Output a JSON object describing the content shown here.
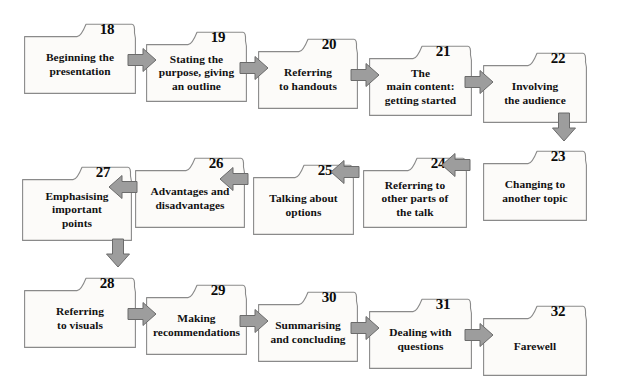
{
  "diagram": {
    "type": "flowchart",
    "orientation": "boustrophedon-serpentine",
    "box_fill": "#fcfbf9",
    "box_stroke": "#8a8a8a",
    "arrow_fill": "#9d9d9d",
    "arrow_stroke": "#6b6b6b",
    "text_color": "#111111",
    "number_color": "#0b0b0b",
    "rows": [
      {
        "row_name": "row-1-left-to-right",
        "direction": "right",
        "nodes": [
          {
            "number": "18",
            "label": "Beginning the\npresentation"
          },
          {
            "number": "19",
            "label": "Stating the\npurpose, giving\nan outline"
          },
          {
            "number": "20",
            "label": "Referring\nto handouts"
          },
          {
            "number": "21",
            "label": "The\nmain content:\ngetting started"
          },
          {
            "number": "22",
            "label": "Involving\nthe audience"
          }
        ]
      },
      {
        "row_name": "row-2-right-to-left",
        "direction": "left",
        "nodes": [
          {
            "number": "23",
            "label": "Changing to\nanother topic"
          },
          {
            "number": "24",
            "label": "Referring to\nother parts of\nthe talk"
          },
          {
            "number": "25",
            "label": "Talking about\noptions"
          },
          {
            "number": "26",
            "label": "Advantages and\ndisadvantages"
          },
          {
            "number": "27",
            "label": "Emphasising\nimportant\npoints"
          }
        ]
      },
      {
        "row_name": "row-3-left-to-right",
        "direction": "right",
        "nodes": [
          {
            "number": "28",
            "label": "Referring\nto visuals"
          },
          {
            "number": "29",
            "label": "Making\nrecommendations"
          },
          {
            "number": "30",
            "label": "Summarising\nand concluding"
          },
          {
            "number": "31",
            "label": "Dealing with\nquestions"
          },
          {
            "number": "32",
            "label": "Farewell"
          }
        ]
      }
    ],
    "connectors": [
      {
        "name": "arrow-18-to-19",
        "icon": "arrow-right-icon",
        "direction": "right"
      },
      {
        "name": "arrow-19-to-20",
        "icon": "arrow-right-icon",
        "direction": "right"
      },
      {
        "name": "arrow-20-to-21",
        "icon": "arrow-right-icon",
        "direction": "right"
      },
      {
        "name": "arrow-21-to-22",
        "icon": "arrow-right-icon",
        "direction": "right"
      },
      {
        "name": "arrow-22-to-23",
        "icon": "arrow-down-icon",
        "direction": "down"
      },
      {
        "name": "arrow-23-to-24",
        "icon": "arrow-left-icon",
        "direction": "left"
      },
      {
        "name": "arrow-24-to-25",
        "icon": "arrow-left-icon",
        "direction": "left"
      },
      {
        "name": "arrow-25-to-26",
        "icon": "arrow-left-icon",
        "direction": "left"
      },
      {
        "name": "arrow-26-to-27",
        "icon": "arrow-left-icon",
        "direction": "left"
      },
      {
        "name": "arrow-27-to-28",
        "icon": "arrow-down-icon",
        "direction": "down"
      },
      {
        "name": "arrow-28-to-29",
        "icon": "arrow-right-icon",
        "direction": "right"
      },
      {
        "name": "arrow-29-to-30",
        "icon": "arrow-right-icon",
        "direction": "right"
      },
      {
        "name": "arrow-30-to-31",
        "icon": "arrow-right-icon",
        "direction": "right"
      },
      {
        "name": "arrow-31-to-32",
        "icon": "arrow-right-icon",
        "direction": "right"
      }
    ]
  },
  "layout": {
    "boxes": [
      {
        "id": "18",
        "x": 24,
        "y": 23,
        "w": 112,
        "h": 71
      },
      {
        "id": "19",
        "x": 146,
        "y": 31,
        "w": 101,
        "h": 71
      },
      {
        "id": "20",
        "x": 258,
        "y": 38,
        "w": 100,
        "h": 71
      },
      {
        "id": "21",
        "x": 369,
        "y": 45,
        "w": 103,
        "h": 71
      },
      {
        "id": "22",
        "x": 483,
        "y": 52,
        "w": 104,
        "h": 71
      },
      {
        "id": "23",
        "x": 483,
        "y": 150,
        "w": 104,
        "h": 71
      },
      {
        "id": "24",
        "x": 363,
        "y": 157,
        "w": 104,
        "h": 71
      },
      {
        "id": "25",
        "x": 253,
        "y": 164,
        "w": 101,
        "h": 71
      },
      {
        "id": "26",
        "x": 135,
        "y": 157,
        "w": 110,
        "h": 71
      },
      {
        "id": "27",
        "x": 22,
        "y": 166,
        "w": 110,
        "h": 75
      },
      {
        "id": "28",
        "x": 24,
        "y": 277,
        "w": 112,
        "h": 71
      },
      {
        "id": "29",
        "x": 146,
        "y": 284,
        "w": 101,
        "h": 71
      },
      {
        "id": "30",
        "x": 258,
        "y": 291,
        "w": 100,
        "h": 71
      },
      {
        "id": "31",
        "x": 369,
        "y": 298,
        "w": 103,
        "h": 71
      },
      {
        "id": "32",
        "x": 483,
        "y": 305,
        "w": 104,
        "h": 71
      }
    ],
    "arrows": [
      {
        "id": "arrow-18-to-19",
        "dir": "right",
        "x": 127,
        "y": 47
      },
      {
        "id": "arrow-19-to-20",
        "dir": "right",
        "x": 239,
        "y": 55
      },
      {
        "id": "arrow-20-to-21",
        "dir": "right",
        "x": 350,
        "y": 62
      },
      {
        "id": "arrow-21-to-22",
        "dir": "right",
        "x": 464,
        "y": 69
      },
      {
        "id": "arrow-22-to-23",
        "dir": "down",
        "x": 551,
        "y": 112
      },
      {
        "id": "arrow-23-to-24",
        "dir": "left",
        "x": 441,
        "y": 152
      },
      {
        "id": "arrow-24-to-25",
        "dir": "left",
        "x": 330,
        "y": 159
      },
      {
        "id": "arrow-25-to-26",
        "dir": "left",
        "x": 219,
        "y": 166
      },
      {
        "id": "arrow-26-to-27",
        "dir": "left",
        "x": 108,
        "y": 174
      },
      {
        "id": "arrow-27-to-28",
        "dir": "down",
        "x": 105,
        "y": 238
      },
      {
        "id": "arrow-28-to-29",
        "dir": "right",
        "x": 127,
        "y": 301
      },
      {
        "id": "arrow-29-to-30",
        "dir": "right",
        "x": 239,
        "y": 308
      },
      {
        "id": "arrow-30-to-31",
        "dir": "right",
        "x": 350,
        "y": 315
      },
      {
        "id": "arrow-31-to-32",
        "dir": "right",
        "x": 464,
        "y": 322
      }
    ]
  }
}
